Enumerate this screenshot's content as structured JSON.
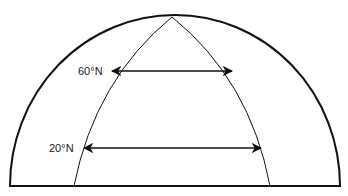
{
  "diagram": {
    "type": "globe-hemisphere-meridians",
    "labels": [
      {
        "id": "lat60",
        "text": "60°N"
      },
      {
        "id": "lat20",
        "text": "20°N"
      }
    ],
    "arrows": [
      {
        "latitude": "60°N",
        "meaning": "distance between meridians at 60°N (shorter)"
      },
      {
        "latitude": "20°N",
        "meaning": "distance between meridians at 20°N (longer)"
      }
    ],
    "colors": {
      "stroke": "#111111",
      "background": "#ffffff"
    }
  }
}
